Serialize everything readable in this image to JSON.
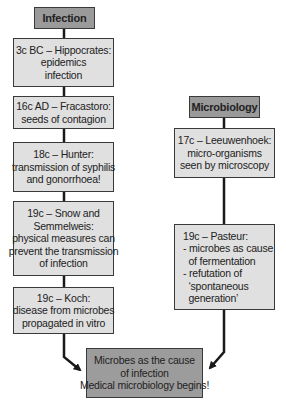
{
  "left_column": {
    "header": "Infection",
    "boxes": [
      {
        "lines": [
          "3c BC – Hippocrates:",
          "epidemics",
          "infection"
        ]
      },
      {
        "lines": [
          "16c AD – Fracastoro:",
          "seeds of contagion"
        ]
      },
      {
        "lines": [
          "18c – Hunter:",
          "transmission of syphilis",
          "and gonorrhoea!"
        ]
      },
      {
        "lines": [
          "19c – Snow and",
          "Semmelweis:",
          "physical measures can",
          "prevent the transmission",
          "of infection"
        ]
      },
      {
        "lines": [
          "19c – Koch:",
          "disease from microbes",
          "propagated in vitro"
        ]
      }
    ]
  },
  "right_column": {
    "header": "Microbiology",
    "boxes": [
      {
        "lines": [
          "17c – Leeuwenhoek:",
          "micro-organisms",
          "seen by microscopy"
        ]
      },
      {
        "lines": [
          "19c – Pasteur:",
          "- microbes as cause",
          "  of fermentation",
          "- refutation of",
          "  ‘spontaneous",
          "  generation’"
        ]
      }
    ]
  },
  "conclusion": {
    "lines": [
      "Microbes as the cause",
      "of infection",
      "Medical microbiology begins!"
    ]
  },
  "colors": {
    "header_fill": "#9a9a9a",
    "box_fill": "#e0e0e0",
    "conclusion_fill": "#9c9c9c",
    "border": "#3a3a3a",
    "connector": "#1a1a1a"
  }
}
